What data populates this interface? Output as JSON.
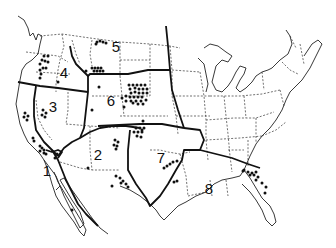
{
  "map": {
    "title": "",
    "description": "Outline map of the United States divided into 8 numbered regions, with dots marking locations",
    "colors": {
      "ink": "#111111",
      "background": "#ffffff"
    },
    "regions": [
      {
        "id": 1,
        "label": "1",
        "x": 47,
        "y": 176
      },
      {
        "id": 2,
        "label": "2",
        "x": 98,
        "y": 160
      },
      {
        "id": 3,
        "label": "3",
        "x": 53,
        "y": 112
      },
      {
        "id": 4,
        "label": "4",
        "x": 64,
        "y": 78
      },
      {
        "id": 5,
        "label": "5",
        "x": 116,
        "y": 52
      },
      {
        "id": 6,
        "label": "6",
        "x": 111,
        "y": 106
      },
      {
        "id": 7,
        "label": "7",
        "x": 161,
        "y": 163
      },
      {
        "id": 8,
        "label": "8",
        "x": 209,
        "y": 194
      }
    ],
    "dots": [
      [
        97,
        42
      ],
      [
        100,
        41
      ],
      [
        103,
        42
      ],
      [
        106,
        43
      ],
      [
        96,
        44
      ],
      [
        92,
        68
      ],
      [
        95,
        68
      ],
      [
        98,
        68
      ],
      [
        101,
        68
      ],
      [
        94,
        71
      ],
      [
        97,
        71
      ],
      [
        100,
        71
      ],
      [
        103,
        71
      ],
      [
        86,
        71
      ],
      [
        44,
        56
      ],
      [
        48,
        56
      ],
      [
        42,
        60
      ],
      [
        45,
        61
      ],
      [
        48,
        62
      ],
      [
        40,
        64
      ],
      [
        43,
        68
      ],
      [
        46,
        68
      ],
      [
        40,
        70
      ],
      [
        41,
        74
      ],
      [
        40,
        78
      ],
      [
        58,
        82
      ],
      [
        99,
        87
      ],
      [
        92,
        110
      ],
      [
        124,
        107
      ],
      [
        129,
        85
      ],
      [
        133,
        85
      ],
      [
        137,
        85
      ],
      [
        141,
        85
      ],
      [
        145,
        85
      ],
      [
        130,
        89
      ],
      [
        135,
        88
      ],
      [
        139,
        89
      ],
      [
        143,
        89
      ],
      [
        147,
        89
      ],
      [
        131,
        93
      ],
      [
        135,
        92
      ],
      [
        139,
        93
      ],
      [
        143,
        93
      ],
      [
        147,
        93
      ],
      [
        126,
        96
      ],
      [
        130,
        97
      ],
      [
        134,
        97
      ],
      [
        138,
        97
      ],
      [
        142,
        97
      ],
      [
        122,
        98
      ],
      [
        126,
        101
      ],
      [
        131,
        101
      ],
      [
        136,
        101
      ],
      [
        141,
        101
      ],
      [
        146,
        100
      ],
      [
        133,
        103
      ],
      [
        138,
        104
      ],
      [
        143,
        104
      ],
      [
        25,
        113
      ],
      [
        28,
        116
      ],
      [
        24,
        117
      ],
      [
        27,
        120
      ],
      [
        43,
        110
      ],
      [
        46,
        113
      ],
      [
        42,
        115
      ],
      [
        45,
        117
      ],
      [
        33,
        138
      ],
      [
        34,
        141
      ],
      [
        40,
        146
      ],
      [
        42,
        148
      ],
      [
        44,
        150
      ],
      [
        40,
        151
      ],
      [
        44,
        153
      ],
      [
        46,
        154
      ],
      [
        57,
        154
      ],
      [
        55,
        158
      ],
      [
        72,
        210
      ],
      [
        115,
        140
      ],
      [
        118,
        142
      ],
      [
        114,
        145
      ],
      [
        117,
        146
      ],
      [
        116,
        149
      ],
      [
        88,
        168
      ],
      [
        136,
        128
      ],
      [
        140,
        128
      ],
      [
        144,
        128
      ],
      [
        134,
        132
      ],
      [
        138,
        132
      ],
      [
        142,
        132
      ],
      [
        137,
        136
      ],
      [
        141,
        137
      ],
      [
        142,
        130
      ],
      [
        143,
        121
      ],
      [
        116,
        176
      ],
      [
        120,
        178
      ],
      [
        123,
        181
      ],
      [
        121,
        183
      ],
      [
        126,
        184
      ],
      [
        112,
        186
      ],
      [
        128,
        187
      ],
      [
        167,
        166
      ],
      [
        170,
        164
      ],
      [
        173,
        162
      ],
      [
        177,
        161
      ],
      [
        164,
        168
      ],
      [
        174,
        182
      ],
      [
        177,
        181
      ],
      [
        243,
        171
      ],
      [
        244,
        170
      ],
      [
        248,
        172
      ],
      [
        252,
        173
      ],
      [
        256,
        172
      ],
      [
        250,
        175
      ],
      [
        254,
        175
      ],
      [
        258,
        177
      ],
      [
        256,
        180
      ],
      [
        262,
        183
      ],
      [
        266,
        187
      ],
      [
        265,
        193
      ]
    ]
  }
}
